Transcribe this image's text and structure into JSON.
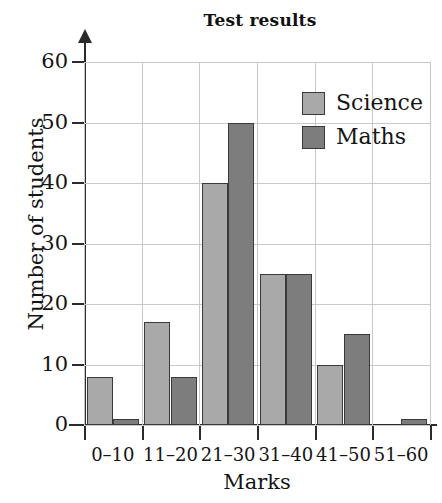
{
  "chart_data": {
    "type": "bar",
    "title": "Test results",
    "xlabel": "Marks",
    "ylabel": "Number of students",
    "categories": [
      "0–10",
      "11–20",
      "21–30",
      "31–40",
      "41–50",
      "51–60"
    ],
    "series": [
      {
        "name": "Science",
        "color": "#a9a9a9",
        "values": [
          8,
          17,
          40,
          25,
          10,
          0
        ]
      },
      {
        "name": "Maths",
        "color": "#7d7d7d",
        "values": [
          1,
          8,
          50,
          25,
          15,
          1
        ]
      }
    ],
    "ylim": [
      0,
      60
    ],
    "yticks": [
      0,
      10,
      20,
      30,
      40,
      50,
      60
    ],
    "ytick_labels": [
      "0",
      "10",
      "20",
      "30",
      "40",
      "50",
      "60"
    ],
    "grid": true,
    "legend_position": "top-right",
    "bar_grouping": "grouped-adjacent"
  },
  "colors": {
    "science": "#a9a9a9",
    "maths": "#7d7d7d",
    "axis": "#2b2b2b",
    "grid": "#c9c9c9",
    "bar_outline": "#3a3a3a",
    "background": "#ffffff",
    "text": "#141414"
  }
}
